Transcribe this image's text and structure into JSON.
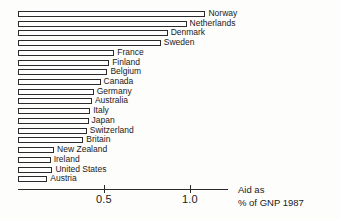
{
  "chart_data": {
    "type": "bar",
    "orientation": "horizontal",
    "title": "",
    "subtitle": "",
    "xlabel": "Aid as % of GNP 1987",
    "ylabel": "",
    "xlim": [
      0,
      1.27
    ],
    "grid": false,
    "legend": null,
    "xticks": [
      0.5,
      1.0
    ],
    "xtick_labels": [
      "0.5",
      "1.0"
    ],
    "categories": [
      "Norway",
      "Netherlands",
      "Denmark",
      "Sweden",
      "France",
      "Finland",
      "Belgium",
      "Canada",
      "Germany",
      "Australia",
      "Italy",
      "Japan",
      "Switzerland",
      "Britain",
      "New Zealand",
      "Ireland",
      "United States",
      "Austria"
    ],
    "values": [
      1.09,
      0.98,
      0.87,
      0.83,
      0.56,
      0.53,
      0.52,
      0.48,
      0.44,
      0.43,
      0.42,
      0.41,
      0.4,
      0.38,
      0.21,
      0.19,
      0.2,
      0.17
    ]
  },
  "caption": {
    "line1": "Aid as",
    "line2": "% of GNP 1987"
  }
}
